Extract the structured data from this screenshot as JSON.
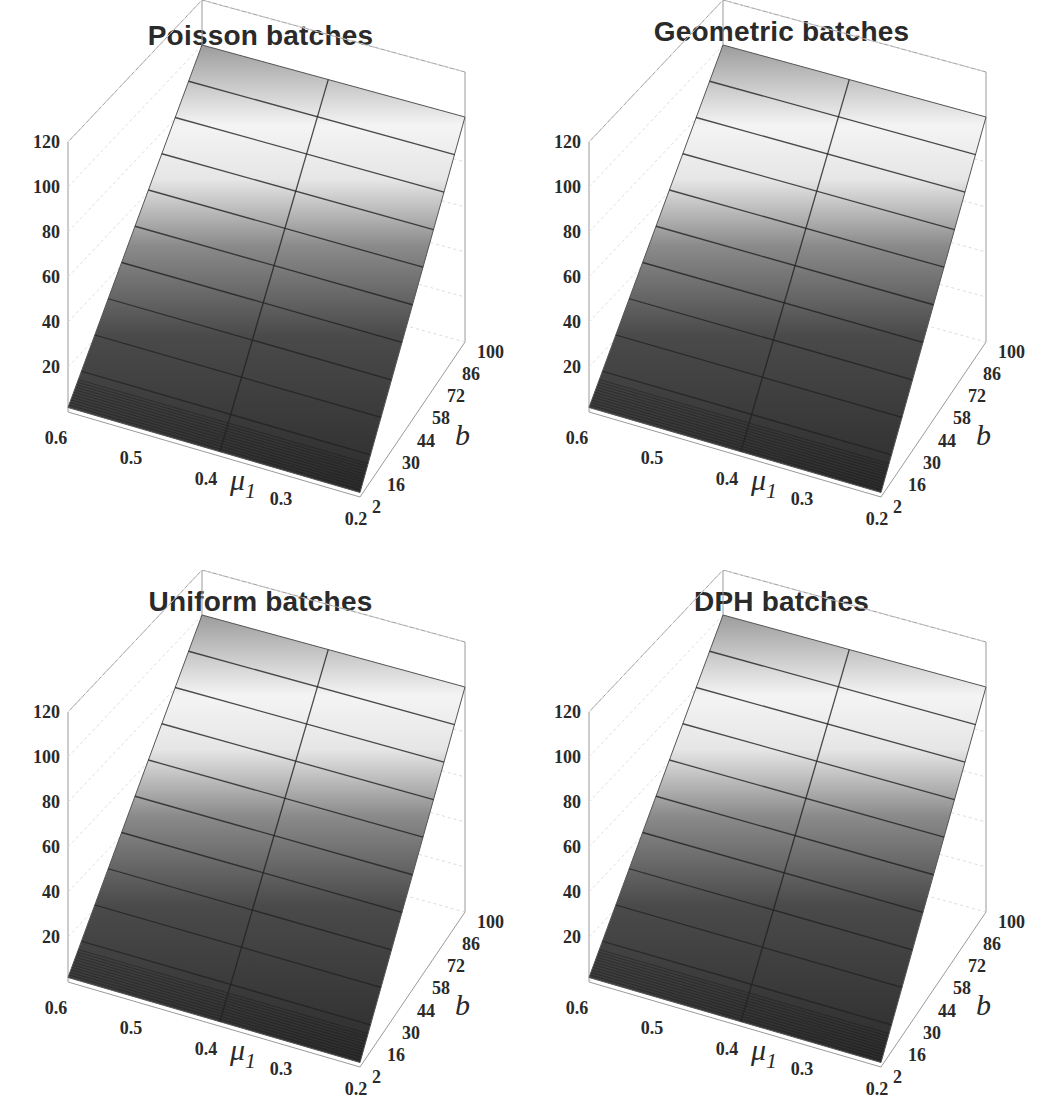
{
  "figure": {
    "panels": [
      {
        "title": "Poisson batches"
      },
      {
        "title": "Geometric batches"
      },
      {
        "title": "Uniform batches"
      },
      {
        "title": "DPH batches"
      }
    ]
  },
  "chart_data": [
    {
      "type": "surface",
      "title": "Poisson batches",
      "xlabel": "μ1",
      "ylabel": "b",
      "zlabel": "",
      "x_ticks": [
        "0.6",
        "0.5",
        "0.4",
        "0.3",
        "0.2"
      ],
      "y_ticks": [
        "2",
        "16",
        "30",
        "44",
        "58",
        "72",
        "86",
        "100"
      ],
      "z_ticks": [
        "20",
        "40",
        "60",
        "80",
        "100",
        "120"
      ],
      "xlim": [
        0.2,
        0.6
      ],
      "ylim": [
        2,
        100
      ],
      "zlim": [
        0,
        120
      ],
      "x": [
        0.6,
        0.4,
        0.2
      ],
      "y": [
        2,
        16,
        30,
        44,
        58,
        72,
        86,
        100
      ],
      "z_description": "Surface increases roughly linearly in b from ~2 at b=2 to ~100 at b=100; nearly constant across μ1",
      "z": [
        [
          2,
          2,
          2
        ],
        [
          15,
          15,
          15
        ],
        [
          29,
          29,
          29
        ],
        [
          43,
          43,
          43
        ],
        [
          57,
          57,
          57
        ],
        [
          71,
          71,
          71
        ],
        [
          85,
          85,
          85
        ],
        [
          99,
          99,
          99
        ]
      ],
      "grid": true,
      "shading": "grayscale"
    },
    {
      "type": "surface",
      "title": "Geometric batches",
      "xlabel": "μ1",
      "ylabel": "b",
      "x_ticks": [
        "0.6",
        "0.5",
        "0.4",
        "0.3",
        "0.2"
      ],
      "y_ticks": [
        "2",
        "16",
        "30",
        "44",
        "58",
        "72",
        "86",
        "100"
      ],
      "z_ticks": [
        "20",
        "40",
        "60",
        "80",
        "100",
        "120"
      ],
      "xlim": [
        0.2,
        0.6
      ],
      "ylim": [
        2,
        100
      ],
      "zlim": [
        0,
        120
      ],
      "x": [
        0.6,
        0.4,
        0.2
      ],
      "y": [
        2,
        16,
        30,
        44,
        58,
        72,
        86,
        100
      ],
      "z": [
        [
          2,
          2,
          2
        ],
        [
          16,
          16,
          16
        ],
        [
          30,
          30,
          30
        ],
        [
          44,
          44,
          44
        ],
        [
          58,
          58,
          58
        ],
        [
          72,
          72,
          72
        ],
        [
          86,
          86,
          86
        ],
        [
          100,
          100,
          100
        ]
      ],
      "grid": true,
      "shading": "grayscale"
    },
    {
      "type": "surface",
      "title": "Uniform batches",
      "xlabel": "μ1",
      "ylabel": "b",
      "x_ticks": [
        "0.6",
        "0.5",
        "0.4",
        "0.3",
        "0.2"
      ],
      "y_ticks": [
        "2",
        "16",
        "30",
        "44",
        "58",
        "72",
        "86",
        "100"
      ],
      "z_ticks": [
        "20",
        "40",
        "60",
        "80",
        "100",
        "120"
      ],
      "xlim": [
        0.2,
        0.6
      ],
      "ylim": [
        2,
        100
      ],
      "zlim": [
        0,
        120
      ],
      "x": [
        0.6,
        0.4,
        0.2
      ],
      "y": [
        2,
        16,
        30,
        44,
        58,
        72,
        86,
        100
      ],
      "z": [
        [
          2,
          2,
          2
        ],
        [
          15,
          15,
          15
        ],
        [
          29,
          29,
          29
        ],
        [
          43,
          43,
          43
        ],
        [
          57,
          57,
          57
        ],
        [
          71,
          71,
          71
        ],
        [
          85,
          85,
          85
        ],
        [
          99,
          99,
          99
        ]
      ],
      "grid": true,
      "shading": "grayscale"
    },
    {
      "type": "surface",
      "title": "DPH batches",
      "xlabel": "μ1",
      "ylabel": "b",
      "x_ticks": [
        "0.6",
        "0.5",
        "0.4",
        "0.3",
        "0.2"
      ],
      "y_ticks": [
        "2",
        "16",
        "30",
        "44",
        "58",
        "72",
        "86",
        "100"
      ],
      "z_ticks": [
        "20",
        "40",
        "60",
        "80",
        "100",
        "120"
      ],
      "xlim": [
        0.2,
        0.6
      ],
      "ylim": [
        2,
        100
      ],
      "zlim": [
        0,
        120
      ],
      "x": [
        0.6,
        0.4,
        0.2
      ],
      "y": [
        2,
        16,
        30,
        44,
        58,
        72,
        86,
        100
      ],
      "z": [
        [
          2,
          2,
          2
        ],
        [
          15,
          15,
          15
        ],
        [
          29,
          29,
          29
        ],
        [
          43,
          43,
          43
        ],
        [
          57,
          57,
          57
        ],
        [
          71,
          71,
          71
        ],
        [
          85,
          85,
          85
        ],
        [
          99,
          99,
          99
        ]
      ],
      "grid": true,
      "shading": "grayscale"
    }
  ]
}
